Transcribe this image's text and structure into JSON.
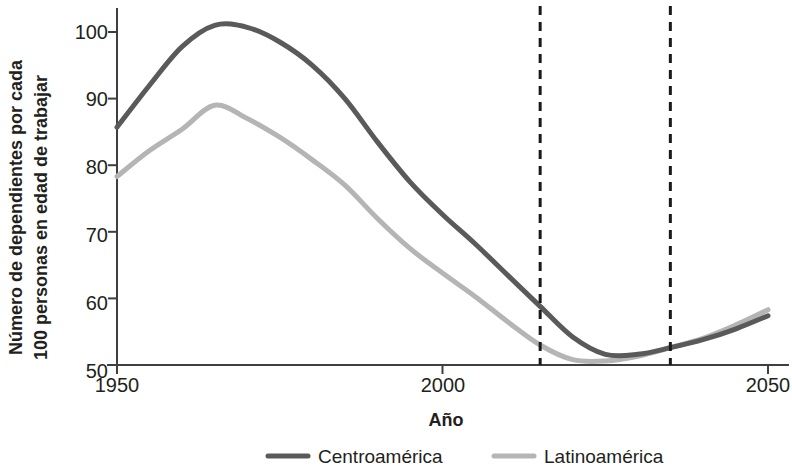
{
  "chart_data": {
    "type": "line",
    "title": "",
    "xlabel": "Año",
    "ylabel": "Número de dependientes por cada 100 personas en edad de trabajar",
    "ylabel_line1": "Número de dependientes por cada",
    "ylabel_line2": "100 personas en edad de trabajar",
    "xlim": [
      1950,
      2050
    ],
    "ylim": [
      50,
      104
    ],
    "xticks": [
      1950,
      2000,
      2050
    ],
    "xtick_labels": [
      "1950",
      "2000",
      "2050"
    ],
    "yticks": [
      50,
      60,
      70,
      80,
      90,
      100
    ],
    "ytick_labels": [
      "50",
      "60",
      "70",
      "80",
      "90",
      "100"
    ],
    "grid": false,
    "legend_position": "bottom",
    "x": [
      1950,
      1955,
      1960,
      1965,
      1970,
      1975,
      1980,
      1985,
      1990,
      1995,
      2000,
      2005,
      2010,
      2015,
      2020,
      2025,
      2030,
      2035,
      2040,
      2045,
      2050
    ],
    "series": [
      {
        "name": "Centroamérica",
        "color": "#5a5a5a",
        "width": 5,
        "values": [
          85.7,
          92.0,
          97.8,
          101.0,
          100.7,
          98.5,
          95.0,
          90.0,
          83.5,
          77.5,
          72.6,
          68.2,
          63.5,
          58.8,
          54.2,
          51.6,
          51.6,
          52.6,
          53.8,
          55.4,
          57.4
        ]
      },
      {
        "name": "Latinoamérica",
        "color": "#b5b5b5",
        "width": 5,
        "values": [
          78.3,
          82.2,
          85.4,
          89.0,
          87.0,
          84.2,
          80.8,
          77.0,
          72.0,
          67.5,
          63.8,
          60.3,
          56.5,
          53.0,
          50.8,
          50.6,
          51.3,
          52.6,
          54.0,
          56.0,
          58.3
        ]
      }
    ],
    "annotations": [
      {
        "type": "vline",
        "x": 2015,
        "style": "dashed",
        "color": "#1a1a1a"
      },
      {
        "type": "vline",
        "x": 2035,
        "style": "dashed",
        "color": "#1a1a1a"
      }
    ],
    "legend": [
      {
        "label": "Centroamérica",
        "color": "#5a5a5a"
      },
      {
        "label": "Latinoamérica",
        "color": "#b5b5b5"
      }
    ]
  }
}
